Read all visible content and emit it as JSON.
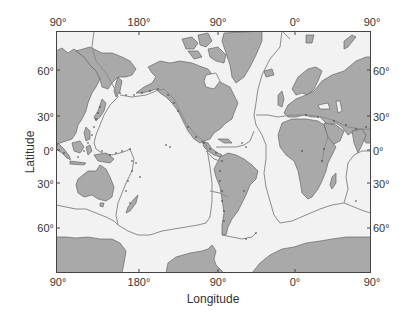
{
  "map": {
    "title": "",
    "x_axis_title": "Longitude",
    "y_axis_title": "Latitude",
    "top_ticks": [
      {
        "label": "90°",
        "x": 68
      },
      {
        "label": "180°",
        "x": 144
      },
      {
        "label": "90°",
        "x": 218
      },
      {
        "label": "0°",
        "x": 295
      },
      {
        "label": "90°",
        "x": 372
      }
    ],
    "bottom_ticks": [
      {
        "label": "90°",
        "x": 58
      },
      {
        "label": "180°",
        "x": 138
      },
      {
        "label": "90°",
        "x": 217
      },
      {
        "label": "0°",
        "x": 295
      },
      {
        "label": "90°",
        "x": 372
      }
    ],
    "left_ticks": [
      {
        "label": "60°",
        "y": 71
      },
      {
        "label": "30°",
        "y": 117
      },
      {
        "label": "0°",
        "y": 151
      },
      {
        "label": "30°",
        "y": 184
      },
      {
        "label": "60°",
        "y": 228
      }
    ],
    "right_ticks": [
      {
        "label": "60°",
        "y": 71
      },
      {
        "label": "30°",
        "y": 117
      },
      {
        "label": "0°",
        "y": 151
      },
      {
        "label": "30°",
        "y": 184
      },
      {
        "label": "60°",
        "y": 228
      }
    ],
    "colors": {
      "ocean": "#f2f2f2",
      "land": "#a9a9a9",
      "coastline": "#555555",
      "plate_boundary": "#8c8c8c",
      "earthquake": "#333333",
      "frame": "#444444"
    },
    "legend": []
  }
}
